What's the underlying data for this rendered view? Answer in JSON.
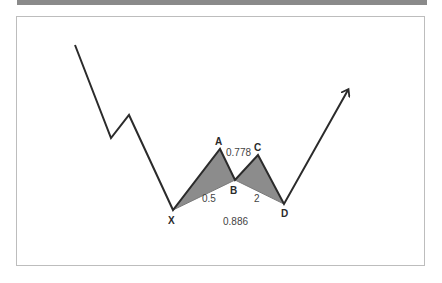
{
  "diagram": {
    "title": "",
    "pattern": "harmonic-pattern",
    "colors": {
      "line": "#2b2b2b",
      "fill": "#888888",
      "frame": "#bdbdbd",
      "topbar": "#8a8a8a"
    },
    "points": {
      "X": {
        "label": "X",
        "x": 173,
        "y": 210
      },
      "A": {
        "label": "A",
        "x": 220,
        "y": 149
      },
      "B": {
        "label": "B",
        "x": 235,
        "y": 180
      },
      "C": {
        "label": "C",
        "x": 258,
        "y": 155
      },
      "D": {
        "label": "D",
        "x": 284,
        "y": 204
      }
    },
    "ratios": {
      "xb": "0.5",
      "ac": "0.778",
      "bd": "2",
      "xd": "0.886"
    }
  }
}
